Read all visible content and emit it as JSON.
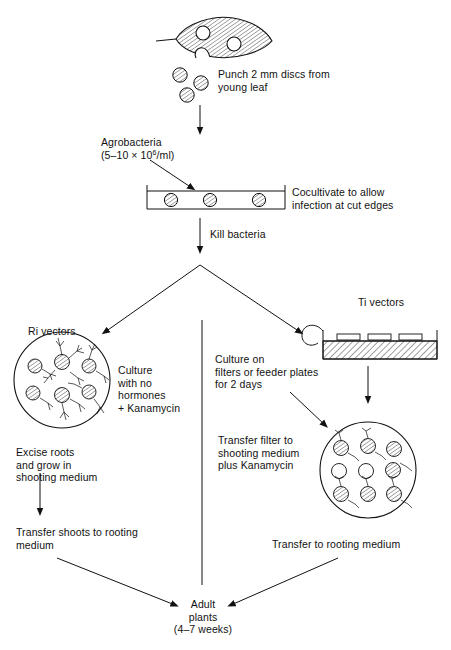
{
  "diagram": {
    "steps": {
      "punch": "Punch 2 mm discs from\nyoung leaf",
      "agrobacteria_line1": "Agrobacteria",
      "agrobacteria_line2_pre": "(5–10 × 10",
      "agrobacteria_exp": "6",
      "agrobacteria_line2_post": "/ml)",
      "cocultivate": "Cocultivate to allow\ninfection at cut edges",
      "kill_bacteria": "Kill bacteria",
      "ri_vectors": "Ri vectors",
      "ti_vectors": "Ti vectors",
      "culture_no_hormones": "Culture\nwith no\nhormones\n+ Kanamycin",
      "culture_on_filters": "Culture on\nfilters or feeder plates\nfor 2 days",
      "transfer_filter": "Transfer filter to\nshooting medium\nplus Kanamycin",
      "excise_roots": "Excise roots\nand grow in\nshooting medium",
      "transfer_shoots": "Transfer shoots to rooting\nmedium",
      "transfer_rooting": "Transfer to rooting medium",
      "adult_plants_line1": "Adult",
      "adult_plants_line2": "plants",
      "adult_plants_line3": "(4–7 weeks)"
    },
    "colors": {
      "stroke": "#111111",
      "background": "#ffffff",
      "text": "#111111"
    }
  }
}
